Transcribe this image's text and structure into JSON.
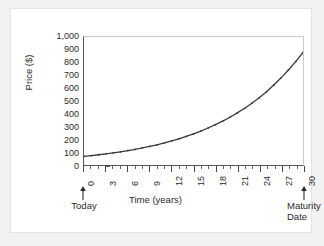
{
  "chart_data": {
    "type": "line",
    "title": "",
    "xlabel": "Time (years)",
    "ylabel": "Price ($)",
    "xlim": [
      0,
      30
    ],
    "ylim": [
      0,
      1000
    ],
    "grid": false,
    "legend": "none",
    "x_ticks": [
      0,
      3,
      6,
      9,
      12,
      15,
      18,
      21,
      24,
      27,
      30
    ],
    "x_tick_labels": [
      "0",
      "3",
      "6",
      "9",
      "12",
      "15",
      "18",
      "21",
      "24",
      "27",
      "30"
    ],
    "x_minor_tick_step": 1,
    "y_ticks": [
      0,
      100,
      200,
      300,
      400,
      500,
      600,
      700,
      800,
      900,
      1000
    ],
    "y_tick_labels": [
      "0",
      "100",
      "200",
      "300",
      "400",
      "500",
      "600",
      "700",
      "800",
      "900",
      "1,000"
    ],
    "series": [
      {
        "name": "Zero-coupon bond price",
        "marker": "small-dot",
        "color": "#3a3a3a",
        "x": [
          0,
          1,
          2,
          3,
          4,
          5,
          6,
          7,
          8,
          9,
          10,
          11,
          12,
          13,
          14,
          15,
          16,
          17,
          18,
          19,
          20,
          21,
          22,
          23,
          24,
          25,
          26,
          27,
          28,
          29,
          30
        ],
        "values": [
          67,
          73,
          80,
          87,
          95,
          103,
          112,
          122,
          133,
          145,
          158,
          172,
          188,
          205,
          223,
          243,
          265,
          289,
          315,
          343,
          373,
          407,
          443,
          483,
          526,
          573,
          625,
          681,
          742,
          808,
          880
        ]
      }
    ],
    "annotations": [
      {
        "label": "Today",
        "x_value": 0,
        "arrow": "up"
      },
      {
        "label": "Maturity\nDate",
        "x_value": 30,
        "arrow": "up"
      }
    ]
  },
  "colors": {
    "panel_background": "#ffffff",
    "page_background": "#f2f2f2",
    "axis": "#555555",
    "curve": "#3a3a3a",
    "text": "#2b2b2b"
  }
}
